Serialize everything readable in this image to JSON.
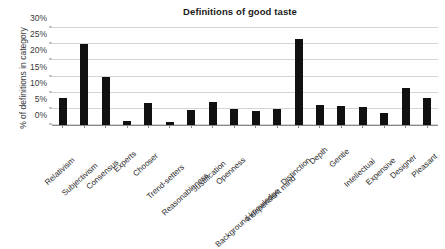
{
  "chart_data": {
    "type": "bar",
    "title": "Definitions of good taste",
    "xlabel": "",
    "ylabel": "% of definitions in category",
    "ylim": [
      0,
      30
    ],
    "ytick_labels": [
      "0%",
      "5%",
      "10%",
      "15%",
      "20%",
      "25%",
      "30%"
    ],
    "ytick_values": [
      0,
      5,
      10,
      15,
      20,
      25,
      30
    ],
    "grid": true,
    "legend": false,
    "bar_color": "#111111",
    "grid_color": "#d4d4d4",
    "axis_color": "#8a8a8a",
    "background_color": "#ffffff",
    "categories": [
      "Relativism",
      "Subjectivism",
      "Consensus",
      "Experts",
      "Chooser",
      "Trend-setters",
      "Reasonableness",
      "Justification",
      "Openness",
      "Background knowledge",
      "Independent mind",
      "Distinction",
      "Depth",
      "Gentle",
      "Intellectual",
      "Expensive",
      "Designer",
      "Pleasant"
    ],
    "values": [
      8.4,
      25.0,
      14.7,
      1.3,
      6.8,
      0.8,
      4.7,
      7.0,
      4.8,
      4.4,
      4.9,
      26.5,
      6.2,
      5.9,
      5.5,
      3.7,
      11.4,
      8.3
    ]
  }
}
